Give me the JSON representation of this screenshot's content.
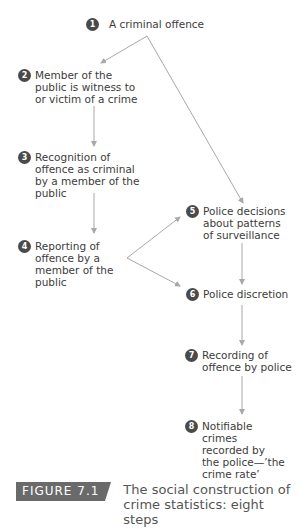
{
  "diagram": {
    "steps": [
      {
        "n": "1",
        "label": "A criminal offence"
      },
      {
        "n": "2",
        "label": "Member of the public is witness to or victim of a crime"
      },
      {
        "n": "3",
        "label": "Recognition of offence as criminal by a member of the public"
      },
      {
        "n": "4",
        "label": "Reporting of offence by a member of the public"
      },
      {
        "n": "5",
        "label": "Police decisions about patterns of surveillance"
      },
      {
        "n": "6",
        "label": "Police discretion"
      },
      {
        "n": "7",
        "label": "Recording of offence by police"
      },
      {
        "n": "8",
        "label": "Notifiable crimes recorded by the police—’the crime rate’"
      }
    ],
    "arrow_color": "#a8a8a8",
    "circle_color": "#4a4a4a"
  },
  "caption": {
    "badge": "FIGURE 7.1",
    "title": "The social construction of crime statistics: eight steps"
  }
}
